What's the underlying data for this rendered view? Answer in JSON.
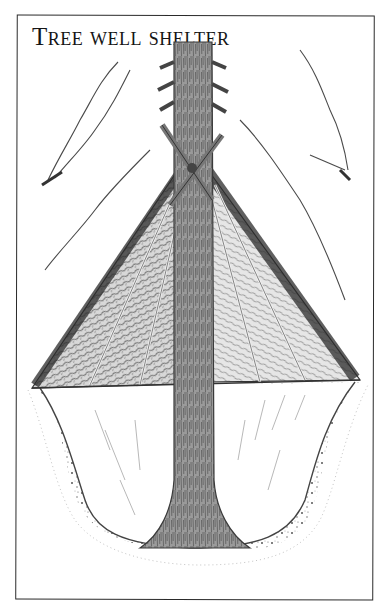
{
  "figure": {
    "title": "Tree well shelter",
    "title_display": "TREE WELL SHELTER",
    "elements": [
      {
        "name": "tree-trunk",
        "label": "Tree trunk"
      },
      {
        "name": "cross-poles",
        "label": "Lashed cross poles"
      },
      {
        "name": "bough-roof",
        "label": "Evergreen bough roof"
      },
      {
        "name": "snow-well",
        "label": "Snow well pit"
      },
      {
        "name": "snow-drifts",
        "label": "Snow-laden branches"
      }
    ],
    "colors": {
      "ink": "#222222",
      "shade_dark": "#3a3a3a",
      "shade_mid": "#8a8a8a",
      "shade_light": "#cfcfcf",
      "paper": "#ffffff"
    }
  }
}
